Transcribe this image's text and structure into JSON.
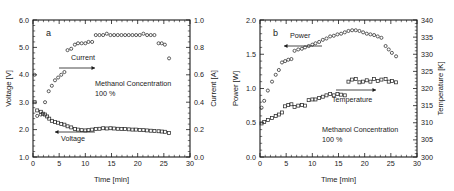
{
  "figure": {
    "panels": [
      {
        "letter": "a",
        "xlabel": "Time [min]",
        "xticks": [
          "0",
          "5",
          "10",
          "15",
          "20",
          "25",
          "30"
        ],
        "left_axis_label": "Voltage [V]",
        "left_ticks": [
          "1.0",
          "2.0",
          "3.0",
          "4.0",
          "5.0",
          "6.0"
        ],
        "right_axis_label": "Current [A]",
        "right_ticks": [
          "0.0",
          "0.2",
          "0.4",
          "0.6",
          "0.8",
          "1.0"
        ],
        "annotation_line1": "Methanol Concentration",
        "annotation_line2": "100 %",
        "series_label_current": "Current",
        "series_label_voltage": "Voltage"
      },
      {
        "letter": "b",
        "xlabel": "Time [min]",
        "xticks": [
          "0",
          "5",
          "10",
          "15",
          "20",
          "25",
          "30"
        ],
        "left_axis_label": "Power [W]",
        "left_ticks": [
          "0.0",
          "0.5",
          "1.0",
          "1.5",
          "2.0"
        ],
        "right_axis_label": "Temperature [K]",
        "right_ticks": [
          "300",
          "305",
          "310",
          "315",
          "320",
          "325",
          "330",
          "335",
          "340"
        ],
        "annotation_line1": "Methanol Concentration",
        "annotation_line2": "100 %",
        "series_label_power": "Power",
        "series_label_temperature": "Temperature"
      }
    ]
  },
  "chart_data": [
    {
      "type": "scatter",
      "title": "a",
      "xlabel": "Time [min]",
      "ylabel": "Voltage [V]",
      "y2label": "Current [A]",
      "xlim": [
        0,
        30
      ],
      "ylim": [
        1.0,
        6.0
      ],
      "y2lim": [
        0.0,
        1.0
      ],
      "xticks": [
        0,
        5,
        10,
        15,
        20,
        25,
        30
      ],
      "yticks": [
        1.0,
        2.0,
        3.0,
        4.0,
        5.0,
        6.0
      ],
      "y2ticks": [
        0.0,
        0.2,
        0.4,
        0.6,
        0.8,
        1.0
      ],
      "grid": false,
      "annotations": [
        "Methanol Concentration",
        "100 %"
      ],
      "series": [
        {
          "name": "Current",
          "axis": "right",
          "marker": "open-circle",
          "unit": "A",
          "x": [
            0.3,
            0.8,
            1.5,
            2.3,
            3.0,
            3.6,
            4.2,
            4.8,
            5.4,
            6.0,
            6.6,
            7.3,
            8.0,
            8.6,
            9.3,
            10.0,
            10.6,
            11.3,
            12.0,
            12.7,
            13.4,
            14.1,
            14.8,
            15.5,
            16.2,
            16.9,
            17.6,
            18.3,
            19.0,
            19.7,
            20.4,
            21.1,
            21.8,
            22.5,
            23.2,
            24.0,
            24.6,
            25.2,
            26.0
          ],
          "y": [
            0.6,
            0.3,
            0.31,
            0.4,
            0.48,
            0.52,
            0.56,
            0.58,
            0.6,
            0.62,
            0.78,
            0.79,
            0.82,
            0.83,
            0.83,
            0.83,
            0.84,
            0.84,
            0.89,
            0.89,
            0.89,
            0.9,
            0.89,
            0.89,
            0.89,
            0.89,
            0.89,
            0.89,
            0.89,
            0.89,
            0.89,
            0.9,
            0.89,
            0.89,
            0.89,
            0.83,
            0.83,
            0.82,
            0.72
          ]
        },
        {
          "name": "Voltage",
          "axis": "left",
          "marker": "open-square",
          "unit": "V",
          "x": [
            0.3,
            0.8,
            1.5,
            1.9,
            2.3,
            2.7,
            3.1,
            3.6,
            4.2,
            4.8,
            5.4,
            6.0,
            6.6,
            7.3,
            8.0,
            8.6,
            9.3,
            10.0,
            10.6,
            11.3,
            12.0,
            12.7,
            13.4,
            14.1,
            14.8,
            15.5,
            16.2,
            16.9,
            17.6,
            18.3,
            19.0,
            19.7,
            20.4,
            21.1,
            21.8,
            22.5,
            23.2,
            24.0,
            24.6,
            25.2,
            26.0
          ],
          "y": [
            3.0,
            2.7,
            2.65,
            2.58,
            2.55,
            2.48,
            2.4,
            2.32,
            2.28,
            2.25,
            2.2,
            2.18,
            2.12,
            2.08,
            2.02,
            2.0,
            1.98,
            1.97,
            1.98,
            2.0,
            2.02,
            2.03,
            2.05,
            2.04,
            2.05,
            2.04,
            2.03,
            2.02,
            2.02,
            2.01,
            2.0,
            2.0,
            1.99,
            1.98,
            1.97,
            1.96,
            1.95,
            1.94,
            1.93,
            1.92,
            1.88
          ]
        }
      ]
    },
    {
      "type": "scatter",
      "title": "b",
      "xlabel": "Time [min]",
      "ylabel": "Power [W]",
      "y2label": "Temperature [K]",
      "xlim": [
        0,
        30
      ],
      "ylim": [
        0.0,
        2.0
      ],
      "y2lim": [
        300,
        340
      ],
      "xticks": [
        0,
        5,
        10,
        15,
        20,
        25,
        30
      ],
      "yticks": [
        0.0,
        0.5,
        1.0,
        1.5,
        2.0
      ],
      "y2ticks": [
        300,
        305,
        310,
        315,
        320,
        325,
        330,
        335,
        340
      ],
      "grid": false,
      "annotations": [
        "Methanol Concentration",
        "100 %"
      ],
      "series": [
        {
          "name": "Power",
          "axis": "left",
          "marker": "open-circle",
          "unit": "W",
          "x": [
            0.3,
            0.8,
            1.5,
            2.3,
            3.0,
            3.6,
            4.2,
            4.8,
            5.4,
            6.0,
            6.6,
            7.3,
            8.0,
            8.6,
            9.3,
            10.0,
            10.6,
            11.3,
            12.0,
            12.7,
            13.4,
            14.1,
            14.8,
            15.5,
            16.2,
            16.9,
            17.6,
            18.3,
            19.0,
            19.7,
            20.4,
            21.1,
            21.8,
            22.5,
            23.2,
            24.0,
            24.6,
            25.2,
            26.0
          ],
          "y": [
            0.72,
            0.82,
            0.97,
            1.1,
            1.2,
            1.27,
            1.38,
            1.4,
            1.42,
            1.43,
            1.55,
            1.57,
            1.58,
            1.6,
            1.62,
            1.64,
            1.66,
            1.68,
            1.71,
            1.73,
            1.76,
            1.77,
            1.79,
            1.8,
            1.82,
            1.84,
            1.85,
            1.85,
            1.84,
            1.82,
            1.8,
            1.79,
            1.78,
            1.76,
            1.74,
            1.62,
            1.57,
            1.52,
            1.47
          ]
        },
        {
          "name": "Temperature",
          "axis": "right",
          "marker": "open-square",
          "unit": "K",
          "x": [
            0.3,
            0.8,
            1.5,
            2.3,
            3.0,
            3.6,
            4.2,
            4.8,
            5.4,
            6.0,
            6.6,
            7.3,
            8.0,
            8.6,
            9.3,
            10.0,
            10.6,
            11.3,
            12.0,
            12.7,
            13.4,
            14.1,
            14.8,
            15.5,
            16.2,
            16.9,
            17.6,
            18.3,
            19.0,
            19.7,
            20.4,
            21.1,
            21.8,
            22.5,
            23.2,
            24.0,
            24.6,
            25.2,
            26.0
          ],
          "y": [
            309.8,
            310.2,
            310.8,
            311.4,
            312.0,
            312.4,
            313.0,
            314.8,
            315.2,
            315.4,
            314.6,
            315.0,
            315.2,
            315.0,
            316.6,
            316.8,
            316.8,
            317.2,
            317.6,
            318.0,
            318.4,
            318.0,
            318.4,
            318.2,
            318.0,
            322.0,
            322.6,
            322.8,
            321.8,
            322.0,
            322.4,
            322.0,
            322.8,
            322.2,
            322.6,
            322.8,
            322.0,
            322.2,
            321.8
          ]
        }
      ]
    }
  ]
}
